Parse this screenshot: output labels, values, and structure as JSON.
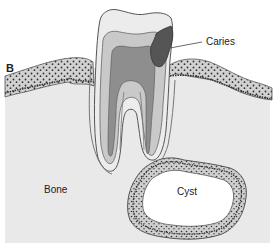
{
  "figure": {
    "panel_letter": "B",
    "labels": {
      "caries": "Caries",
      "bone": "Bone",
      "cyst": "Cyst"
    },
    "colors": {
      "background": "#ffffff",
      "bone": "#e9e9e9",
      "enamel": "#ececec",
      "dentin": "#c9c9c9",
      "pulp": "#8e8e8e",
      "caries": "#555555",
      "gingiva": "#d6d6d6",
      "cyst_wall": "#c8c8c8",
      "cyst_lumen": "#ffffff",
      "outline": "#555555"
    }
  }
}
